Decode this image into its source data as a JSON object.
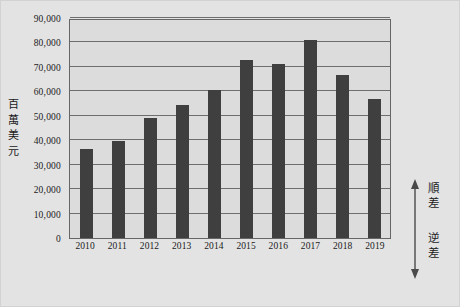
{
  "chart_data": {
    "type": "bar",
    "title": "",
    "subtitle": "",
    "xlabel": "",
    "ylabel": "百萬美元",
    "categories": [
      "2010",
      "2011",
      "2012",
      "2013",
      "2014",
      "2015",
      "2016",
      "2017",
      "2018",
      "2019"
    ],
    "values": [
      36500,
      39800,
      49000,
      54500,
      60500,
      73000,
      71000,
      81000,
      66500,
      57000
    ],
    "ylim": [
      0,
      90000
    ],
    "y_ticks": [
      "0",
      "10,000",
      "20,000",
      "30,000",
      "40,000",
      "50,000",
      "60,000",
      "70,000",
      "80,000",
      "90,000"
    ],
    "y_tick_values": [
      0,
      10000,
      20000,
      30000,
      40000,
      50000,
      60000,
      70000,
      80000,
      90000
    ],
    "grid": true,
    "legend": "none",
    "bar_color": "#3f3f3f",
    "plot_background": "#dcdcdc",
    "figure_background": "#e3e3e3",
    "gridline_color": "#6e6e6e",
    "annotations": {
      "surplus": "順差",
      "deficit": "逆差",
      "arrow": "double-headed-vertical-arrow"
    }
  },
  "axis": {
    "y_title_chars": [
      "百",
      "萬",
      "美",
      "元"
    ]
  },
  "annotation": {
    "surplus_chars": [
      "順",
      "差"
    ],
    "deficit_chars": [
      "逆",
      "差"
    ]
  }
}
